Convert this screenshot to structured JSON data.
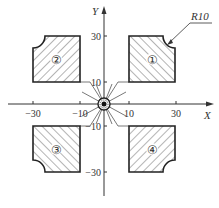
{
  "diagram": {
    "axes": {
      "x_label": "X",
      "y_label": "Y",
      "x_ticks": [
        "−30",
        "−10",
        "10",
        "30"
      ],
      "y_ticks": [
        "30",
        "10",
        "−10",
        "−30"
      ]
    },
    "regions": [
      {
        "id": "region-1",
        "label": "①",
        "quadrant": "I",
        "x": [
          10,
          30
        ],
        "y": [
          10,
          30
        ],
        "rounded_corner": "top-right"
      },
      {
        "id": "region-2",
        "label": "②",
        "quadrant": "II",
        "x": [
          -30,
          -10
        ],
        "y": [
          10,
          30
        ],
        "rounded_corner": "top-left"
      },
      {
        "id": "region-3",
        "label": "③",
        "quadrant": "III",
        "x": [
          -30,
          -10
        ],
        "y": [
          -30,
          -10
        ],
        "rounded_corner": "bottom-left"
      },
      {
        "id": "region-4",
        "label": "④",
        "quadrant": "IV",
        "x": [
          10,
          30
        ],
        "y": [
          -30,
          -10
        ],
        "rounded_corner": "bottom-right"
      }
    ],
    "annotation": {
      "radius_label": "R10"
    },
    "colors": {
      "line": "#333333",
      "hatch": "#444444",
      "background": "#ffffff"
    }
  }
}
